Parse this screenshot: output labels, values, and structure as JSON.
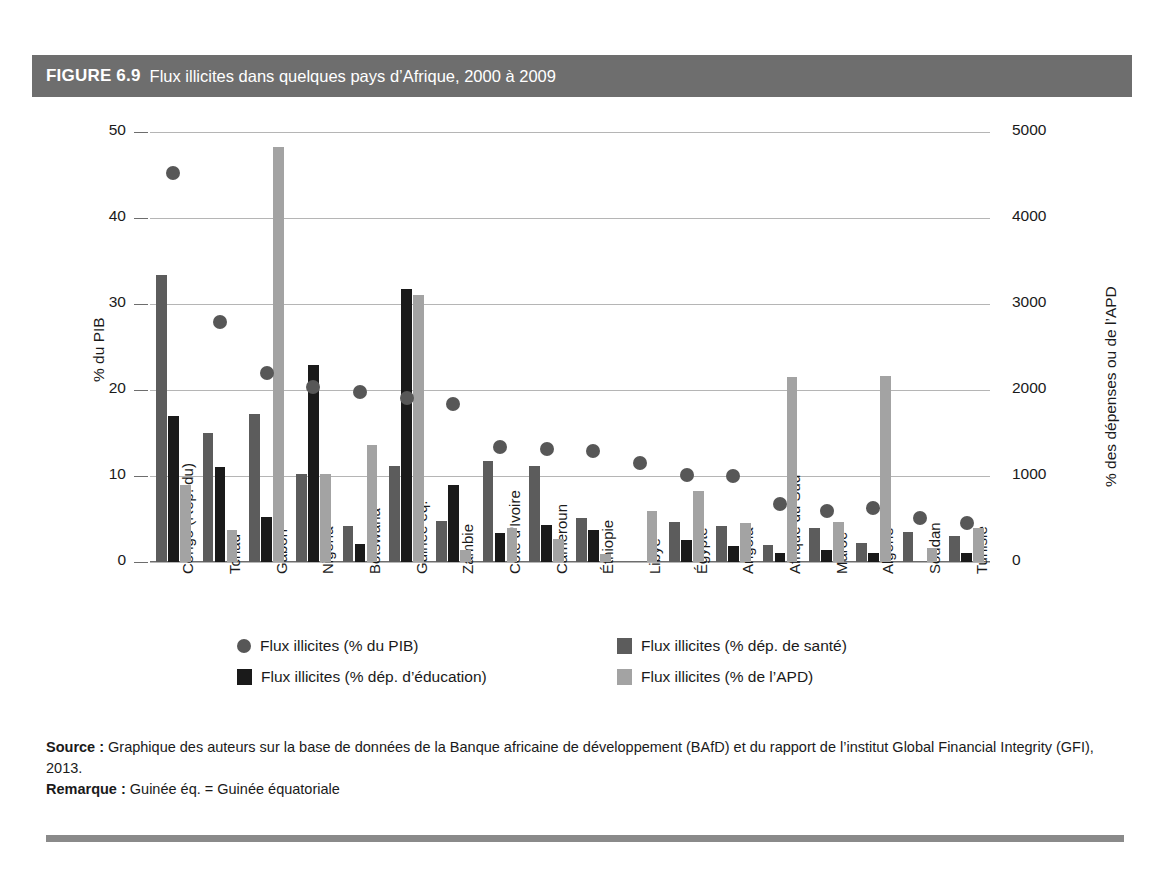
{
  "figure": {
    "number": "FIGURE 6.9",
    "title": "Flux illicites dans quelques pays d’Afrique, 2000 à 2009",
    "source_label": "Source :",
    "source_text": " Graphique des auteurs sur la base de données de la Banque africaine de développement (BAfD) et du rapport de l’institut Global Financial Integrity (GFI), 2013.",
    "remark_label": "Remarque :",
    "remark_text": " Guinée éq. = Guinée équatoriale"
  },
  "colors": {
    "title_bar": "#6e6e6e",
    "dot": "#575757",
    "dark_gray_bar": "#5c5c5c",
    "black_bar": "#1a1a1a",
    "light_gray_bar": "#a3a3a3",
    "gridline": "#b5b5b5",
    "bottom_rule": "#8a8a8a"
  },
  "chart_data": {
    "type": "bar",
    "title": "Flux illicites dans quelques pays d’Afrique, 2000 à 2009",
    "xlabel": "",
    "ylabel": "% du PIB",
    "ylabel_right": "% des dépenses ou de l’APD",
    "ylim": [
      0,
      50
    ],
    "ylim_right": [
      0,
      5000
    ],
    "yticks": [
      "0",
      "10",
      "20",
      "30",
      "40",
      "50"
    ],
    "yticks_right": [
      "0",
      "1000",
      "2000",
      "3000",
      "4000",
      "5000"
    ],
    "grid": true,
    "legend_position": "bottom",
    "categories": [
      "Congo (Rép. du)",
      "Tchad",
      "Gabon",
      "Nigéria",
      "Botswana",
      "Guinée éq.",
      "Zambie",
      "Côte d'Ivoire",
      "Cameroun",
      "Éthiopie",
      "Libye",
      "Égypte",
      "Angola",
      "Afrique du Sud",
      "Maroc",
      "Algérie",
      "Soudan",
      "Tunisie"
    ],
    "series": [
      {
        "name": "Flux illicites (% du PIB)",
        "marker": "dot",
        "axis": "left",
        "color": "#575757",
        "values": [
          45.2,
          27.9,
          22.0,
          20.4,
          19.8,
          19.1,
          18.4,
          13.4,
          13.1,
          12.9,
          11.5,
          10.1,
          10.0,
          6.8,
          5.9,
          6.3,
          5.1,
          4.5
        ]
      },
      {
        "name": "Flux illicites (% dép. de santé)",
        "marker": "bar",
        "axis": "right",
        "color": "#5c5c5c",
        "values": [
          33.4,
          15.0,
          17.2,
          10.2,
          4.2,
          11.2,
          4.8,
          11.7,
          11.2,
          5.1,
          0,
          4.7,
          4.2,
          2.0,
          3.9,
          2.2,
          3.5,
          3.0
        ]
      },
      {
        "name": "Flux illicites (% dép. d’éducation)",
        "marker": "bar",
        "axis": "right",
        "color": "#1a1a1a",
        "values": [
          17.0,
          11.0,
          5.2,
          22.9,
          2.1,
          31.8,
          8.9,
          3.4,
          4.3,
          3.7,
          0,
          2.6,
          1.9,
          1.0,
          1.4,
          1.1,
          0,
          1.1
        ]
      },
      {
        "name": "Flux illicites (% de l’APD)",
        "marker": "bar",
        "axis": "right",
        "color": "#a3a3a3",
        "values": [
          9.0,
          3.7,
          48.3,
          10.2,
          13.6,
          31.0,
          1.4,
          4.0,
          2.7,
          0.9,
          5.9,
          8.3,
          4.5,
          21.5,
          4.7,
          21.6,
          1.6,
          4.0
        ]
      }
    ]
  }
}
